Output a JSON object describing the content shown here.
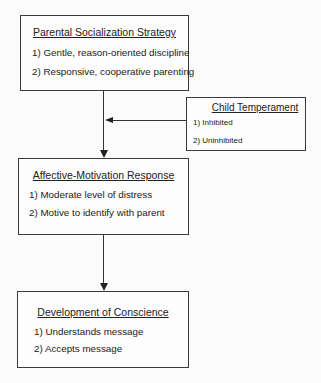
{
  "diagram": {
    "strategy": {
      "title": "Parental Socialization Strategy",
      "items": [
        "1)  Gentle, reason-oriented discipline",
        "2)  Responsive,  cooperative parenting"
      ]
    },
    "temperament": {
      "title": "Child Temperament",
      "items": [
        "1)  Inhibited",
        "2)  Uninhibited"
      ]
    },
    "response": {
      "title": "Affective-Motivation Response",
      "items": [
        "1)  Moderate level of distress",
        "2)  Motive to identify with parent"
      ]
    },
    "conscience": {
      "title": "Development of Conscience",
      "items": [
        "1)  Understands message",
        "2)  Accepts message"
      ]
    },
    "edges": [
      {
        "from": "strategy",
        "to": "response"
      },
      {
        "from": "temperament",
        "to": "strategy-response-edge"
      },
      {
        "from": "response",
        "to": "conscience"
      }
    ]
  }
}
